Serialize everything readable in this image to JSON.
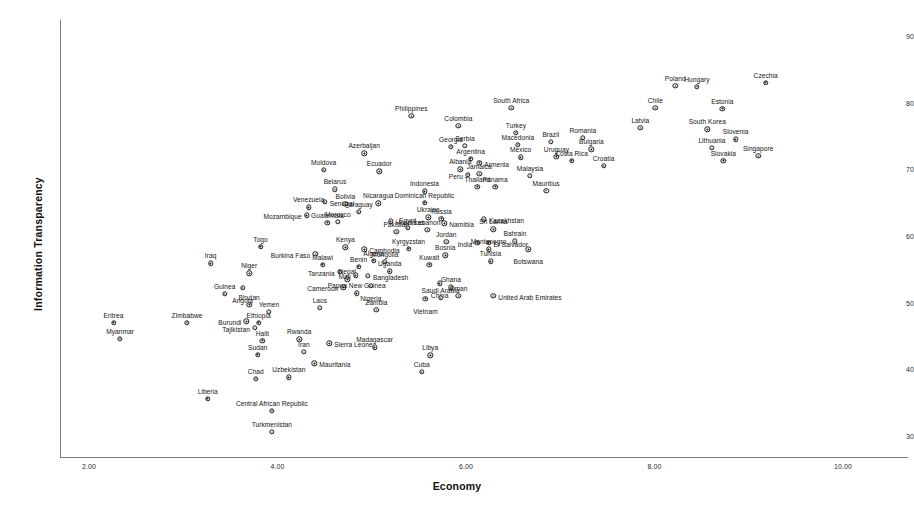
{
  "chart_data": {
    "type": "scatter",
    "title": "",
    "xlabel": "Economy",
    "ylabel": "Information Transparency",
    "xlim": [
      1.55,
      10.55
    ],
    "ylim": [
      28.2,
      92.4
    ],
    "xticks": [
      "2.00",
      "4.00",
      "6.00",
      "8.00",
      "10.00"
    ],
    "xtick_values": [
      2,
      4,
      6,
      8,
      10
    ],
    "yticks": [
      "90",
      "80",
      "70",
      "60",
      "50",
      "40",
      "30"
    ],
    "ytick_values": [
      90,
      80,
      70,
      60,
      50,
      40,
      30
    ],
    "grid": false,
    "legend": null,
    "marker": "open-circle-with-dot",
    "point_count": 140,
    "points": [
      {
        "label": "Eritrea",
        "x": 2.26,
        "y": 47.0,
        "pos": "above"
      },
      {
        "label": "Myanmar",
        "x": 2.33,
        "y": 44.6,
        "pos": "above"
      },
      {
        "label": "Zimbabwe",
        "x": 3.04,
        "y": 47.0,
        "pos": "above"
      },
      {
        "label": "Liberia",
        "x": 3.26,
        "y": 35.6,
        "pos": "above"
      },
      {
        "label": "Guinea",
        "x": 3.44,
        "y": 51.3,
        "pos": "above"
      },
      {
        "label": "Iraq",
        "x": 3.29,
        "y": 55.9,
        "pos": "above"
      },
      {
        "label": "Togo",
        "x": 3.82,
        "y": 58.4,
        "pos": "above"
      },
      {
        "label": "Niger",
        "x": 3.7,
        "y": 54.4,
        "pos": "above"
      },
      {
        "label": "Angola",
        "x": 3.63,
        "y": 52.2,
        "pos": "below"
      },
      {
        "label": "Bhutan",
        "x": 3.7,
        "y": 49.7,
        "pos": "above"
      },
      {
        "label": "Burundi",
        "x": 3.67,
        "y": 47.2,
        "pos": "left"
      },
      {
        "label": "Ethiopia",
        "x": 3.8,
        "y": 47.0,
        "pos": "above"
      },
      {
        "label": "Yemen",
        "x": 3.91,
        "y": 48.6,
        "pos": "above"
      },
      {
        "label": "Tajikistan",
        "x": 3.76,
        "y": 46.2,
        "pos": "left"
      },
      {
        "label": "Haiti",
        "x": 3.84,
        "y": 44.3,
        "pos": "above"
      },
      {
        "label": "Sudan",
        "x": 3.79,
        "y": 42.2,
        "pos": "above"
      },
      {
        "label": "Chad",
        "x": 3.77,
        "y": 38.6,
        "pos": "above"
      },
      {
        "label": "Central African Republic",
        "x": 3.94,
        "y": 33.8,
        "pos": "above"
      },
      {
        "label": "Turkmenistan",
        "x": 3.94,
        "y": 30.6,
        "pos": "above"
      },
      {
        "label": "Rwanda",
        "x": 4.23,
        "y": 44.5,
        "pos": "above"
      },
      {
        "label": "Iran",
        "x": 4.28,
        "y": 42.6,
        "pos": "above"
      },
      {
        "label": "Uzbekistan",
        "x": 4.12,
        "y": 38.8,
        "pos": "above"
      },
      {
        "label": "Mauritania",
        "x": 4.39,
        "y": 40.9,
        "pos": "right"
      },
      {
        "label": "Sierra Leone",
        "x": 4.55,
        "y": 43.9,
        "pos": "right"
      },
      {
        "label": "Laos",
        "x": 4.45,
        "y": 49.2,
        "pos": "above"
      },
      {
        "label": "Madagascar",
        "x": 5.03,
        "y": 43.3,
        "pos": "above"
      },
      {
        "label": "Libya",
        "x": 5.62,
        "y": 42.1,
        "pos": "above"
      },
      {
        "label": "Cuba",
        "x": 5.53,
        "y": 39.6,
        "pos": "above"
      },
      {
        "label": "Mozambique",
        "x": 4.31,
        "y": 63.1,
        "pos": "left"
      },
      {
        "label": "Burkina Faso",
        "x": 4.4,
        "y": 57.3,
        "pos": "left"
      },
      {
        "label": "Malawi",
        "x": 4.48,
        "y": 55.7,
        "pos": "above"
      },
      {
        "label": "Kenya",
        "x": 4.72,
        "y": 58.3,
        "pos": "above"
      },
      {
        "label": "Tanzania",
        "x": 4.66,
        "y": 54.6,
        "pos": "left"
      },
      {
        "label": "Nepal",
        "x": 4.74,
        "y": 53.5,
        "pos": "above"
      },
      {
        "label": "Cameroon",
        "x": 4.7,
        "y": 52.3,
        "pos": "left"
      },
      {
        "label": "Papua New Guinea",
        "x": 4.84,
        "y": 51.4,
        "pos": "above"
      },
      {
        "label": "Benin",
        "x": 4.86,
        "y": 55.4,
        "pos": "above"
      },
      {
        "label": "Mali",
        "x": 4.83,
        "y": 54.1,
        "pos": "left"
      },
      {
        "label": "Bangladesh",
        "x": 4.96,
        "y": 54.0,
        "pos": "right"
      },
      {
        "label": "Nigeria",
        "x": 4.99,
        "y": 52.5,
        "pos": "below"
      },
      {
        "label": "Cambodia",
        "x": 4.92,
        "y": 58.0,
        "pos": "right"
      },
      {
        "label": "Algeria",
        "x": 5.02,
        "y": 56.3,
        "pos": "above"
      },
      {
        "label": "Mongolia",
        "x": 5.14,
        "y": 56.1,
        "pos": "above"
      },
      {
        "label": "Uganda",
        "x": 5.19,
        "y": 54.7,
        "pos": "above"
      },
      {
        "label": "Zambia",
        "x": 5.05,
        "y": 48.9,
        "pos": "above"
      },
      {
        "label": "Guatemala",
        "x": 4.53,
        "y": 62.0,
        "pos": "above"
      },
      {
        "label": "Morocco",
        "x": 4.64,
        "y": 62.1,
        "pos": "above"
      },
      {
        "label": "Senegal",
        "x": 4.5,
        "y": 65.1,
        "pos": "right"
      },
      {
        "label": "Venezuela",
        "x": 4.33,
        "y": 64.3,
        "pos": "above"
      },
      {
        "label": "Moldova",
        "x": 4.49,
        "y": 69.9,
        "pos": "above"
      },
      {
        "label": "Belarus",
        "x": 4.61,
        "y": 67.0,
        "pos": "above"
      },
      {
        "label": "Bolivia",
        "x": 4.72,
        "y": 64.8,
        "pos": "above"
      },
      {
        "label": "Paraguay",
        "x": 4.86,
        "y": 63.6,
        "pos": "above"
      },
      {
        "label": "Azerbaijan",
        "x": 4.92,
        "y": 72.4,
        "pos": "above"
      },
      {
        "label": "Ecuador",
        "x": 5.08,
        "y": 69.7,
        "pos": "above"
      },
      {
        "label": "Nicaragua",
        "x": 5.07,
        "y": 64.9,
        "pos": "above"
      },
      {
        "label": "Honduras",
        "x": 5.2,
        "y": 62.2,
        "pos": "right"
      },
      {
        "label": "Pakistan",
        "x": 5.26,
        "y": 60.6,
        "pos": "above"
      },
      {
        "label": "Egypt",
        "x": 5.38,
        "y": 61.2,
        "pos": "above"
      },
      {
        "label": "Lebanon",
        "x": 5.59,
        "y": 60.9,
        "pos": "above"
      },
      {
        "label": "Kyrgyzstan",
        "x": 5.39,
        "y": 58.1,
        "pos": "above"
      },
      {
        "label": "Kuwait",
        "x": 5.61,
        "y": 55.7,
        "pos": "above"
      },
      {
        "label": "Indonesia",
        "x": 5.56,
        "y": 66.7,
        "pos": "above"
      },
      {
        "label": "Dominican Republic",
        "x": 5.56,
        "y": 65.0,
        "pos": "above"
      },
      {
        "label": "Ukraine",
        "x": 5.6,
        "y": 62.8,
        "pos": "above"
      },
      {
        "label": "Russia",
        "x": 5.74,
        "y": 62.6,
        "pos": "above"
      },
      {
        "label": "Namibia",
        "x": 5.77,
        "y": 61.9,
        "pos": "right"
      },
      {
        "label": "Jordan",
        "x": 5.79,
        "y": 59.1,
        "pos": "above"
      },
      {
        "label": "Bosnia",
        "x": 5.78,
        "y": 57.1,
        "pos": "above"
      },
      {
        "label": "China",
        "x": 5.72,
        "y": 52.9,
        "pos": "below"
      },
      {
        "label": "Ghana",
        "x": 5.84,
        "y": 52.3,
        "pos": "above"
      },
      {
        "label": "Oman",
        "x": 5.92,
        "y": 51.0,
        "pos": "above"
      },
      {
        "label": "Vietnam",
        "x": 5.57,
        "y": 50.6,
        "pos": "below"
      },
      {
        "label": "Saudi Arabia",
        "x": 5.73,
        "y": 50.7,
        "pos": "above"
      },
      {
        "label": "Philippines",
        "x": 5.42,
        "y": 78.0,
        "pos": "above"
      },
      {
        "label": "Colombia",
        "x": 5.92,
        "y": 76.5,
        "pos": "above"
      },
      {
        "label": "Georgia",
        "x": 5.84,
        "y": 73.4,
        "pos": "above"
      },
      {
        "label": "Serbia",
        "x": 5.99,
        "y": 73.5,
        "pos": "above"
      },
      {
        "label": "Argentina",
        "x": 6.05,
        "y": 71.6,
        "pos": "above"
      },
      {
        "label": "Armenia",
        "x": 6.14,
        "y": 71.0,
        "pos": "right"
      },
      {
        "label": "Albania",
        "x": 5.94,
        "y": 70.0,
        "pos": "above"
      },
      {
        "label": "Peru",
        "x": 6.02,
        "y": 69.2,
        "pos": "left"
      },
      {
        "label": "Jamaica",
        "x": 6.14,
        "y": 69.3,
        "pos": "above"
      },
      {
        "label": "Thailand",
        "x": 6.12,
        "y": 67.4,
        "pos": "above"
      },
      {
        "label": "Panama",
        "x": 6.31,
        "y": 67.4,
        "pos": "above"
      },
      {
        "label": "Kazakhstan",
        "x": 6.19,
        "y": 62.5,
        "pos": "right"
      },
      {
        "label": "Sri Lanka",
        "x": 6.29,
        "y": 61.0,
        "pos": "above"
      },
      {
        "label": "India",
        "x": 6.12,
        "y": 59.0,
        "pos": "left"
      },
      {
        "label": "El Salvador",
        "x": 6.24,
        "y": 59.0,
        "pos": "right"
      },
      {
        "label": "Montenegro",
        "x": 6.24,
        "y": 58.0,
        "pos": "above"
      },
      {
        "label": "Tunisia",
        "x": 6.26,
        "y": 56.2,
        "pos": "above"
      },
      {
        "label": "Bahrain",
        "x": 6.52,
        "y": 59.2,
        "pos": "above"
      },
      {
        "label": "United Arab Emirates",
        "x": 6.29,
        "y": 51.0,
        "pos": "right"
      },
      {
        "label": "Botswana",
        "x": 6.66,
        "y": 58.0,
        "pos": "below"
      },
      {
        "label": "South Africa",
        "x": 6.48,
        "y": 79.2,
        "pos": "above"
      },
      {
        "label": "Turkey",
        "x": 6.53,
        "y": 75.5,
        "pos": "above"
      },
      {
        "label": "Macedonia",
        "x": 6.55,
        "y": 73.7,
        "pos": "above"
      },
      {
        "label": "Mexico",
        "x": 6.58,
        "y": 71.8,
        "pos": "above"
      },
      {
        "label": "Malaysia",
        "x": 6.68,
        "y": 69.0,
        "pos": "above"
      },
      {
        "label": "Mauritius",
        "x": 6.85,
        "y": 66.8,
        "pos": "above"
      },
      {
        "label": "Brazil",
        "x": 6.9,
        "y": 74.1,
        "pos": "above"
      },
      {
        "label": "Uruguay",
        "x": 6.96,
        "y": 71.9,
        "pos": "above"
      },
      {
        "label": "Costa Rica",
        "x": 7.12,
        "y": 71.3,
        "pos": "above"
      },
      {
        "label": "Romania",
        "x": 7.24,
        "y": 74.7,
        "pos": "above"
      },
      {
        "label": "Bulgaria",
        "x": 7.33,
        "y": 73.0,
        "pos": "above"
      },
      {
        "label": "Croatia",
        "x": 7.46,
        "y": 70.5,
        "pos": "above"
      },
      {
        "label": "Latvia",
        "x": 7.85,
        "y": 76.2,
        "pos": "above"
      },
      {
        "label": "Poland",
        "x": 8.22,
        "y": 82.5,
        "pos": "above"
      },
      {
        "label": "Hungary",
        "x": 8.45,
        "y": 82.4,
        "pos": "above"
      },
      {
        "label": "Czechia",
        "x": 9.18,
        "y": 83.0,
        "pos": "above"
      },
      {
        "label": "Chile",
        "x": 8.01,
        "y": 79.2,
        "pos": "above"
      },
      {
        "label": "Estonia",
        "x": 8.72,
        "y": 79.1,
        "pos": "above"
      },
      {
        "label": "South Korea",
        "x": 8.56,
        "y": 76.0,
        "pos": "above"
      },
      {
        "label": "Slovenia",
        "x": 8.86,
        "y": 74.5,
        "pos": "above"
      },
      {
        "label": "Lithuania",
        "x": 8.61,
        "y": 73.2,
        "pos": "above"
      },
      {
        "label": "Singapore",
        "x": 9.1,
        "y": 72.0,
        "pos": "above"
      },
      {
        "label": "Slovakia",
        "x": 8.73,
        "y": 71.3,
        "pos": "above"
      }
    ]
  }
}
